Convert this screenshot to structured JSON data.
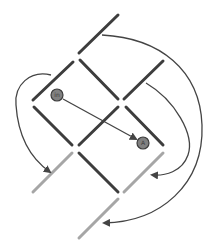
{
  "colors": {
    "background": "#ffffff",
    "dark_segment": "#3d3d3d",
    "light_segment": "#a6a6a6",
    "arrow": "#444444",
    "node_fill": "#808080",
    "node_stroke": "#3c3c3c"
  },
  "nodes": [
    {
      "id": "node-1",
      "label": "in",
      "x": 57,
      "y": 95
    },
    {
      "id": "node-2",
      "label": "A",
      "x": 143,
      "y": 143
    }
  ],
  "segments": {
    "dark": [
      {
        "x1": 79,
        "y1": 53,
        "x2": 118,
        "y2": 15
      },
      {
        "x1": 33,
        "y1": 100,
        "x2": 73,
        "y2": 62
      },
      {
        "x1": 80,
        "y1": 60,
        "x2": 118,
        "y2": 99
      },
      {
        "x1": 124,
        "y1": 99,
        "x2": 163,
        "y2": 61
      },
      {
        "x1": 34,
        "y1": 107,
        "x2": 72,
        "y2": 145
      },
      {
        "x1": 79,
        "y1": 145,
        "x2": 118,
        "y2": 107
      },
      {
        "x1": 126,
        "y1": 107,
        "x2": 163,
        "y2": 145
      },
      {
        "x1": 79,
        "y1": 153,
        "x2": 118,
        "y2": 192
      }
    ],
    "light": [
      {
        "x1": 33,
        "y1": 192,
        "x2": 72,
        "y2": 153
      },
      {
        "x1": 124,
        "y1": 192,
        "x2": 163,
        "y2": 153
      },
      {
        "x1": 79,
        "y1": 238,
        "x2": 118,
        "y2": 199
      }
    ]
  },
  "arrows": [
    {
      "id": "arrow-node1-to-node2",
      "path": "M 63 99 L 136 139"
    },
    {
      "id": "arrow-left-loop",
      "path": "M 51 75 C 30 70, 14 85, 16 105 C 18 135, 30 158, 50 172"
    },
    {
      "id": "arrow-right-inner",
      "path": "M 146 83 C 175 100, 195 135, 188 155 C 182 172, 165 176, 152 175"
    },
    {
      "id": "arrow-right-outer",
      "path": "M 102 35 C 160 38, 200 70, 202 125 C 204 185, 160 222, 104 223"
    }
  ]
}
